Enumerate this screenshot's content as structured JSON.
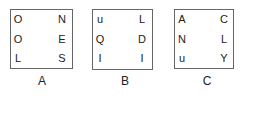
{
  "puzzles": [
    {
      "label": "A",
      "letters": [
        [
          "O",
          "N"
        ],
        [
          "O",
          "E"
        ],
        [
          "L",
          "S"
        ]
      ]
    },
    {
      "label": "B",
      "letters": [
        [
          "u",
          "L"
        ],
        [
          "Q",
          "D"
        ],
        [
          "I",
          "I"
        ]
      ]
    },
    {
      "label": "C",
      "letters": [
        [
          "A",
          "C"
        ],
        [
          "N",
          "L"
        ],
        [
          "u",
          "Y"
        ]
      ]
    }
  ]
}
